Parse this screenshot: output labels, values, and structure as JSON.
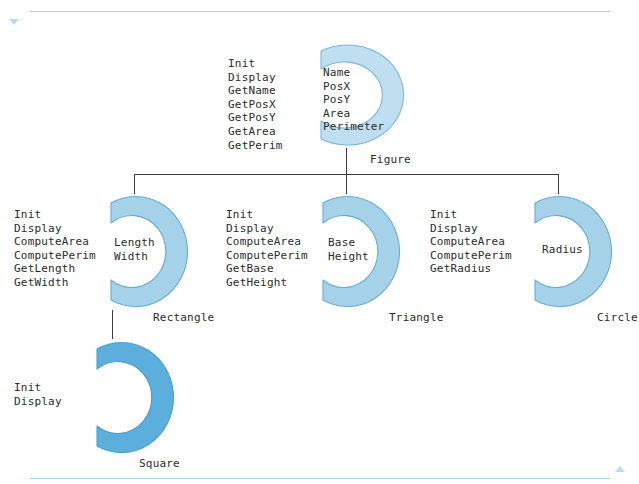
{
  "page": {
    "background": "#ffffff",
    "rule_color": "#a9d2e8",
    "marker_color": "#bcdcee",
    "connector_color": "#3c3c3c",
    "text_color": "#2b2b2b"
  },
  "markers": {
    "top_marker": "▽",
    "bottom_marker": "△"
  },
  "diagram": {
    "type": "class-hierarchy",
    "root": "Figure",
    "inheritance": [
      {
        "parent": "Figure",
        "child": "Rectangle"
      },
      {
        "parent": "Figure",
        "child": "Triangle"
      },
      {
        "parent": "Figure",
        "child": "Circle"
      },
      {
        "parent": "Rectangle",
        "child": "Square"
      }
    ],
    "classes": [
      {
        "id": "figure",
        "name": "Figure",
        "ring_fill": "#bfdff0",
        "ring_edge": "#7ab8d8",
        "attributes": [
          "Name",
          "PosX",
          "PosY",
          "Area",
          "Perimeter"
        ],
        "methods": [
          "Init",
          "Display",
          "GetName",
          "GetPosX",
          "GetPosY",
          "GetArea",
          "GetPerim"
        ]
      },
      {
        "id": "rectangle",
        "name": "Rectangle",
        "ring_fill": "#a6d2e9",
        "ring_edge": "#67aed4",
        "attributes": [
          "Length",
          "Width"
        ],
        "methods": [
          "Init",
          "Display",
          "ComputeArea",
          "ComputePerim",
          "GetLength",
          "GetWidth"
        ]
      },
      {
        "id": "triangle",
        "name": "Triangle",
        "ring_fill": "#a6d2e9",
        "ring_edge": "#67aed4",
        "attributes": [
          "Base",
          "Height"
        ],
        "methods": [
          "Init",
          "Display",
          "ComputeArea",
          "ComputePerim",
          "GetBase",
          "GetHeight"
        ]
      },
      {
        "id": "circle",
        "name": "Circle",
        "ring_fill": "#a6d2e9",
        "ring_edge": "#67aed4",
        "attributes": [
          "Radius"
        ],
        "methods": [
          "Init",
          "Display",
          "ComputeArea",
          "ComputePerim",
          "GetRadius"
        ]
      },
      {
        "id": "square",
        "name": "Square",
        "ring_fill": "#5cafdc",
        "ring_edge": "#4a9fcd",
        "attributes": [],
        "methods": [
          "Init",
          "Display"
        ]
      }
    ]
  }
}
